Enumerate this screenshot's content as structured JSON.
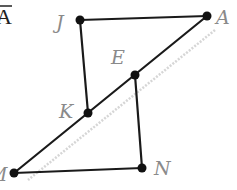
{
  "header_fragment": "A",
  "points": {
    "J": {
      "label": "J",
      "x": 80,
      "y": 20
    },
    "A": {
      "label": "A",
      "x": 207,
      "y": 16
    },
    "E": {
      "label": "E",
      "x": 135,
      "y": 75
    },
    "K": {
      "label": "K",
      "x": 88,
      "y": 113
    },
    "M": {
      "label": "M",
      "x": 14,
      "y": 173
    },
    "N": {
      "label": "N",
      "x": 142,
      "y": 168
    }
  },
  "segments": [
    [
      "J",
      "A"
    ],
    [
      "J",
      "K"
    ],
    [
      "A",
      "M"
    ],
    [
      "E",
      "N"
    ],
    [
      "M",
      "N"
    ]
  ],
  "colors": {
    "line": "#1a1a1a",
    "label": "#8a8a8a",
    "shadow": "#d6d6d6"
  }
}
